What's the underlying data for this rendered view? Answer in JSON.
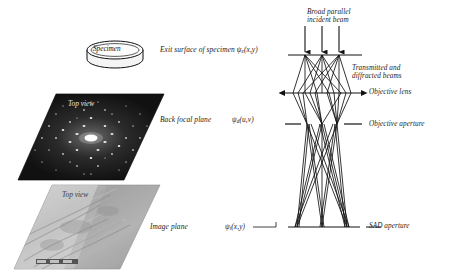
{
  "figure": {
    "domain": "Diagram",
    "background_color": "#ffffff",
    "ink_color": "#1a1a1a"
  },
  "left_column": {
    "specimen": {
      "disc_label": "Specimen",
      "caption": "Exit surface of specimen",
      "wavefunction": "ψ",
      "wavefunction_sub": "e",
      "wavefunction_args": "(x,y)"
    },
    "back_focal_plane": {
      "topview_label": "Top view",
      "caption": "Back focal plane",
      "wavefunction": "ψ",
      "wavefunction_sub": "d",
      "wavefunction_args": "(u,v)",
      "panel_type": "diffraction-pattern",
      "panel_fill": "#171717"
    },
    "image_plane": {
      "topview_label": "Top view",
      "caption": "Image plane",
      "wavefunction": "ψ",
      "wavefunction_sub": "i",
      "wavefunction_args": "(x,y)",
      "panel_type": "bright-field-micrograph",
      "panel_fill": "#b9b9b9"
    }
  },
  "ray_diagram": {
    "incident_beam_label": "Broad parallel\nincident beam",
    "incident_beam_label_line1": "Broad parallel",
    "incident_beam_label_line2": "incident beam",
    "transmitted_label_line1": "Transmitted and",
    "transmitted_label_line2": "diffracted beams",
    "objective_lens_label": "Objective lens",
    "objective_aperture_label": "Objective aperture",
    "sad_aperture_label": "SAD aperture",
    "beam_count": 3,
    "planes": [
      {
        "name": "specimen-plane",
        "y": 55,
        "style": "solid-line"
      },
      {
        "name": "objective-lens-plane",
        "y": 93,
        "style": "double-arrow-line"
      },
      {
        "name": "objective-aperture-plane",
        "y": 124,
        "style": "dashed-pair"
      },
      {
        "name": "sad-aperture-plane",
        "y": 227,
        "style": "solid-line-with-stub"
      }
    ]
  }
}
